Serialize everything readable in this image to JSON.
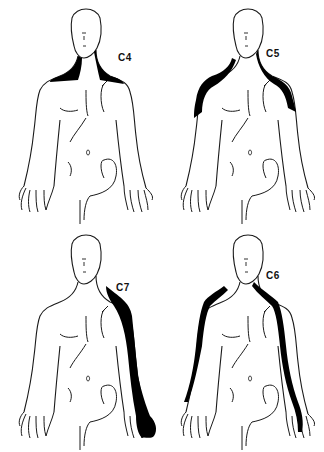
{
  "figure": {
    "panels": [
      {
        "id": "c4",
        "label": "C4",
        "region": "neck and top of shoulders (bilateral)"
      },
      {
        "id": "c5",
        "label": "C5",
        "region": "shoulders and lateral upper arms (bilateral)"
      },
      {
        "id": "c7",
        "label": "C7",
        "region": "posterior/lateral arm to middle fingers (one side)"
      },
      {
        "id": "c6",
        "label": "C6",
        "region": "lateral arm and forearm to thumb (bilateral)"
      }
    ]
  },
  "colors": {
    "outline": "#1a1a1a",
    "fill": "#000000",
    "background": "#ffffff"
  }
}
